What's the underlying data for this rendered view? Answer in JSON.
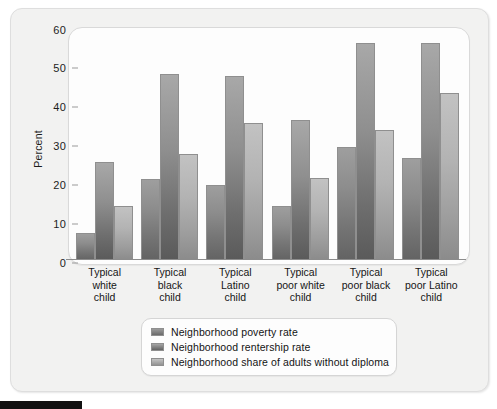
{
  "chart_data": {
    "type": "bar",
    "title": "",
    "xlabel": "",
    "ylabel": "Percent",
    "ylim": [
      0,
      60
    ],
    "yticks": [
      0,
      10,
      20,
      30,
      40,
      50,
      60
    ],
    "grid": false,
    "legend_position": "bottom",
    "categories": [
      "Typical white child",
      "Typical black child",
      "Typical Latino child",
      "Typical poor white child",
      "Typical poor black child",
      "Typical poor Latino child"
    ],
    "category_lines": [
      [
        "Typical",
        "white",
        "child"
      ],
      [
        "Typical",
        "black",
        "child"
      ],
      [
        "Typical",
        "Latino",
        "child"
      ],
      [
        "Typical",
        "poor white",
        "child"
      ],
      [
        "Typical",
        "poor black",
        "child"
      ],
      [
        "Typical",
        "poor Latino",
        "child"
      ]
    ],
    "series": [
      {
        "name": "Neighborhood poverty rate",
        "color": "#7a7a7a",
        "values": [
          7.0,
          21.2,
          19.6,
          14.1,
          29.5,
          26.6
        ]
      },
      {
        "name": "Neighborhood rentership rate",
        "color": "#6d6d6d",
        "values": [
          25.6,
          48.4,
          48.1,
          36.4,
          56.7,
          56.7
        ]
      },
      {
        "name": "Neighborhood share of adults without diploma",
        "color": "#b0b0b0",
        "values": [
          14.1,
          27.7,
          35.7,
          21.5,
          33.9,
          43.6
        ]
      }
    ]
  },
  "axis": {
    "y_title": "Percent",
    "y_tick_labels": [
      "60",
      "50",
      "40",
      "30",
      "20",
      "10",
      "0"
    ]
  },
  "legend": {
    "items": [
      "Neighborhood poverty rate",
      "Neighborhood rentership rate",
      "Neighborhood share of adults without diploma"
    ]
  }
}
